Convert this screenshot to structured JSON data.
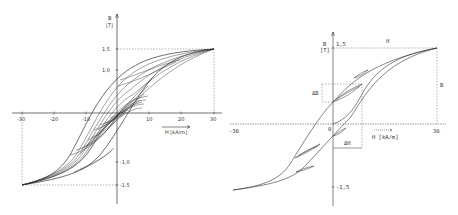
{
  "left_diagram": {
    "title": "Family of hysteresis loops (minor loops)",
    "y_axis": {
      "symbol": "B",
      "unit": "[T]",
      "ticks": [
        "1,5",
        "1,0",
        "-1,0",
        "-1,5"
      ]
    },
    "x_axis": {
      "label": "H [kA/m]",
      "ticks": [
        "-30",
        "-20",
        "-10",
        "10",
        "20",
        "30"
      ]
    }
  },
  "right_diagram": {
    "title": "Major hysteresis loop with minor loops and ΔB/ΔH",
    "y_axis": {
      "symbol": "B",
      "unit": "[T]",
      "ticks": [
        "1,5",
        "-1,5"
      ]
    },
    "x_axis": {
      "label": "H [kA/m]",
      "ticks": [
        "-30",
        "0",
        "30"
      ]
    },
    "annotations": {
      "delta_b": "ΔB",
      "delta_h": "ΔH",
      "h_label": "H",
      "b_label": "B"
    }
  },
  "colors": {
    "line": "#333333",
    "dashed": "#555555",
    "background": "#ffffff"
  }
}
